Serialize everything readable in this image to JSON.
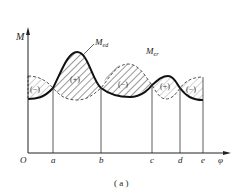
{
  "diagram": {
    "caption": "( a )",
    "y_axis_label": "M",
    "x_axis_label": "φ",
    "origin_label": "O",
    "curve_labels": {
      "driving": "M",
      "driving_sub": "ed",
      "resisting": "M",
      "resisting_sub": "er"
    },
    "points": [
      {
        "label": "a"
      },
      {
        "label": "b"
      },
      {
        "label": "c"
      },
      {
        "label": "d"
      },
      {
        "label": "e"
      }
    ],
    "regions": [
      {
        "sign": "(−)",
        "between": "O-a"
      },
      {
        "sign": "(+)",
        "between": "a-b"
      },
      {
        "sign": "(−)",
        "between": "b-c"
      },
      {
        "sign": "(+)",
        "between": "c-d"
      },
      {
        "sign": "(−)",
        "between": "d-e"
      }
    ]
  }
}
